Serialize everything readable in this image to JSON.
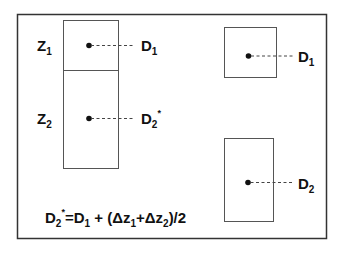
{
  "diagram": {
    "left_column": {
      "layers": [
        {
          "label": "Z",
          "sub": "1",
          "point_label": "D",
          "point_sub": "1",
          "point_sup": ""
        },
        {
          "label": "Z",
          "sub": "2",
          "point_label": "D",
          "point_sub": "2",
          "point_sup": "*"
        }
      ]
    },
    "right_column": {
      "top": {
        "point_label": "D",
        "point_sub": "1"
      },
      "bottom": {
        "point_label": "D",
        "point_sub": "2"
      }
    },
    "formula": {
      "lhs": "D",
      "lhs_sub": "2",
      "lhs_sup": "*",
      "p1": "=D",
      "p1_sub": "1",
      "p2": " + (Δz",
      "p2_sub": "1",
      "p3": "+Δz",
      "p3_sub": "2",
      "p4": ")/2"
    },
    "colors": {
      "line": "#444444",
      "frame": "#333333",
      "text": "#111111"
    }
  }
}
